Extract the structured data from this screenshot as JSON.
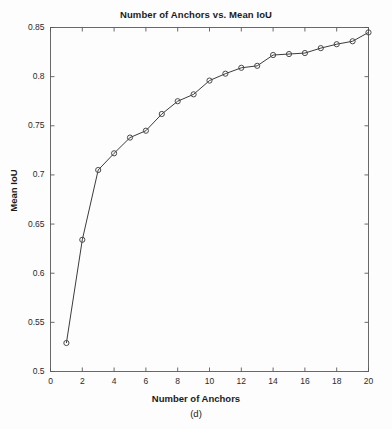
{
  "figure": {
    "caption": "(d)",
    "background_color": "#fdfdfd",
    "axis_color": "#5a5a5a",
    "line_color": "#3c3c3c",
    "marker_color": "#4a4a4a"
  },
  "chart_data": {
    "type": "line",
    "title": "Number of Anchors vs. Mean IoU",
    "xlabel": "Number of Anchors",
    "ylabel": "Mean IoU",
    "x": [
      1,
      2,
      3,
      4,
      5,
      6,
      7,
      8,
      9,
      10,
      11,
      12,
      13,
      14,
      15,
      16,
      17,
      18,
      19,
      20
    ],
    "values": [
      0.529,
      0.634,
      0.705,
      0.722,
      0.738,
      0.745,
      0.762,
      0.775,
      0.782,
      0.796,
      0.803,
      0.809,
      0.811,
      0.822,
      0.823,
      0.824,
      0.829,
      0.833,
      0.836,
      0.845
    ],
    "series": [
      {
        "name": "Mean IoU",
        "values": [
          0.529,
          0.634,
          0.705,
          0.722,
          0.738,
          0.745,
          0.762,
          0.775,
          0.782,
          0.796,
          0.803,
          0.809,
          0.811,
          0.822,
          0.823,
          0.824,
          0.829,
          0.833,
          0.836,
          0.845
        ]
      }
    ],
    "xlim": [
      0,
      20
    ],
    "ylim": [
      0.5,
      0.85
    ],
    "xticks": [
      0,
      2,
      4,
      6,
      8,
      10,
      12,
      14,
      16,
      18,
      20
    ],
    "xtick_labels": [
      "0",
      "2",
      "4",
      "6",
      "8",
      "10",
      "12",
      "14",
      "16",
      "18",
      "20"
    ],
    "yticks": [
      0.5,
      0.55,
      0.6,
      0.65,
      0.7,
      0.75,
      0.8,
      0.85
    ],
    "ytick_labels": [
      "0.5",
      "0.55",
      "0.6",
      "0.65",
      "0.7",
      "0.75",
      "0.8",
      "0.85"
    ],
    "grid": false,
    "legend": null,
    "marker": "circle-open",
    "box": true
  }
}
